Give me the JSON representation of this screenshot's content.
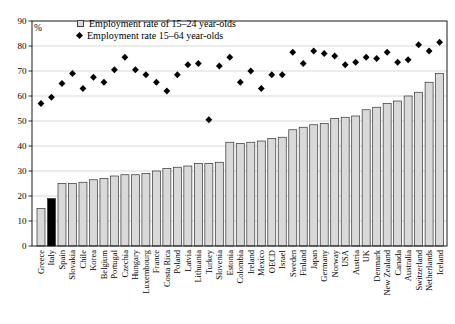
{
  "chart_data": {
    "type": "bar",
    "title": "",
    "ylabel": "%",
    "xlabel": "",
    "ylim": [
      0,
      90
    ],
    "ytick_step": 10,
    "grid": true,
    "legend_position": "top-left-inside",
    "highlighted_category": "Italy",
    "categories": [
      "Greece",
      "Italy",
      "Spain",
      "Slovakia",
      "Chile",
      "Korea",
      "Belgium",
      "Portugal",
      "Czechia",
      "Hungary",
      "Luxembourg",
      "France",
      "Costa Rica",
      "Poland",
      "Latvia",
      "Lithuania",
      "Turkey",
      "Slovenia",
      "Estonia",
      "Colombia",
      "Ireland",
      "Mexico",
      "OECD",
      "Israel",
      "Sweden",
      "Finland",
      "Japan",
      "Germany",
      "Norway",
      "USA",
      "Austria",
      "UK",
      "Denmark",
      "New Zealand",
      "Canada",
      "Australia",
      "Switzerland",
      "Netherlands",
      "Iceland"
    ],
    "series": [
      {
        "name": "Employment rate of 15–24 year-olds",
        "render": "bar",
        "values": [
          15,
          19,
          25,
          25,
          25.5,
          26.5,
          27,
          28,
          28.5,
          28.5,
          29,
          30,
          31,
          31.5,
          32,
          33,
          33,
          33.5,
          41.5,
          41,
          41.5,
          42,
          43,
          43.5,
          46.5,
          47.5,
          48.5,
          49,
          51,
          51.5,
          52,
          54.5,
          55.5,
          57,
          58,
          60,
          61.5,
          65.5,
          69
        ]
      },
      {
        "name": "Employment rate 15–64 year-olds",
        "render": "scatter-diamond",
        "values": [
          57,
          59.5,
          65,
          69,
          63,
          67.5,
          65.5,
          70.5,
          75.5,
          70.5,
          68.5,
          65.5,
          62,
          68.5,
          72.5,
          73,
          50.5,
          72,
          75.5,
          65.5,
          70,
          63,
          68.5,
          68.5,
          77.5,
          73,
          78,
          77,
          76,
          72.5,
          73.5,
          75.5,
          75,
          77.5,
          73.5,
          74.5,
          80.5,
          78,
          81.5
        ]
      }
    ]
  },
  "colors": {
    "bar_fill": "#d9d9d9",
    "bar_stroke": "#333333",
    "highlight_fill": "#000000",
    "marker": "#000000",
    "grid": "#c9c9c9",
    "axis": "#000000",
    "background": "#ffffff"
  }
}
